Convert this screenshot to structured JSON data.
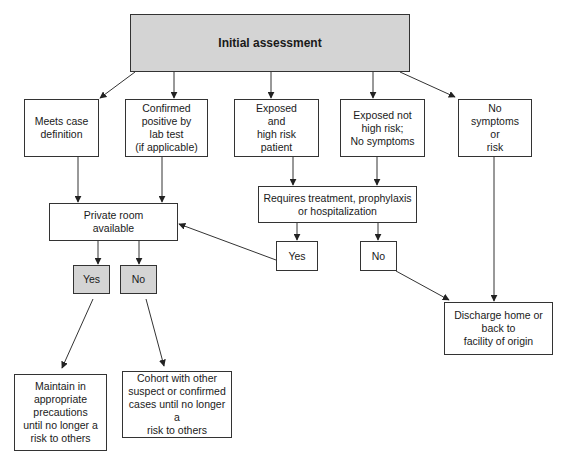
{
  "diagram": {
    "type": "flowchart",
    "colors": {
      "line": "#333333",
      "shaded_fill": "#d4d4d4",
      "plain_fill": "#ffffff"
    },
    "nodes": {
      "initial": {
        "label": "Initial assessment"
      },
      "meets_case": {
        "label": "Meets case\ndefinition"
      },
      "confirmed_positive": {
        "label": "Confirmed\npositive by\nlab test\n(if applicable)"
      },
      "exposed_high_risk": {
        "label": "Exposed\nand\nhigh risk\npatient"
      },
      "exposed_not_high_risk": {
        "label": "Exposed not\nhigh risk;\nNo symptoms"
      },
      "no_symptoms": {
        "label": "No\nsymptoms\nor\nrisk"
      },
      "private_room": {
        "label": "Private room\navailable"
      },
      "private_yes": {
        "label": "Yes"
      },
      "private_no": {
        "label": "No"
      },
      "requires_treatment": {
        "label": "Requires treatment, prophylaxis\nor hospitalization"
      },
      "treatment_yes": {
        "label": "Yes"
      },
      "treatment_no": {
        "label": "No"
      },
      "discharge": {
        "label": "Discharge home or\nback to\nfacility of origin"
      },
      "maintain_precautions": {
        "label": "Maintain in\nappropriate\nprecautions\nuntil no longer a\nrisk to others"
      },
      "cohort": {
        "label": "Cohort with other\nsuspect or confirmed\ncases until no longer a\nrisk to others"
      }
    },
    "edges": [
      {
        "from": "initial",
        "to": "meets_case"
      },
      {
        "from": "initial",
        "to": "confirmed_positive"
      },
      {
        "from": "initial",
        "to": "exposed_high_risk"
      },
      {
        "from": "initial",
        "to": "exposed_not_high_risk"
      },
      {
        "from": "initial",
        "to": "no_symptoms"
      },
      {
        "from": "meets_case",
        "to": "private_room"
      },
      {
        "from": "confirmed_positive",
        "to": "private_room"
      },
      {
        "from": "exposed_high_risk",
        "to": "requires_treatment"
      },
      {
        "from": "exposed_not_high_risk",
        "to": "requires_treatment"
      },
      {
        "from": "requires_treatment",
        "to": "treatment_yes"
      },
      {
        "from": "requires_treatment",
        "to": "treatment_no"
      },
      {
        "from": "treatment_yes",
        "to": "private_room"
      },
      {
        "from": "treatment_no",
        "to": "discharge"
      },
      {
        "from": "no_symptoms",
        "to": "discharge"
      },
      {
        "from": "private_room",
        "to": "private_yes"
      },
      {
        "from": "private_room",
        "to": "private_no"
      },
      {
        "from": "private_yes",
        "to": "maintain_precautions"
      },
      {
        "from": "private_no",
        "to": "cohort"
      }
    ]
  }
}
